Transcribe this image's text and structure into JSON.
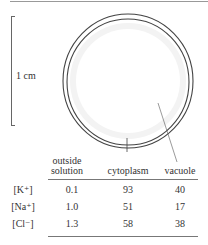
{
  "diagram": {
    "scale_label": "1 cm",
    "labels": {
      "cytoplasm_pointer": "cytoplasm",
      "vacuole_pointer": "vacuole"
    }
  },
  "table": {
    "columns": [
      "outside solution",
      "cytoplasm",
      "vacuole"
    ],
    "column_line1": [
      "outside",
      "cytoplasm",
      "vacuole"
    ],
    "column_line2": [
      "solution",
      "",
      ""
    ],
    "rows": [
      {
        "ion": "[K⁺]",
        "values": [
          "0.1",
          "93",
          "40"
        ]
      },
      {
        "ion": "[Na⁺]",
        "values": [
          "1.0",
          "51",
          "17"
        ]
      },
      {
        "ion": "[Cl⁻]",
        "values": [
          "1.3",
          "58",
          "38"
        ]
      }
    ]
  }
}
